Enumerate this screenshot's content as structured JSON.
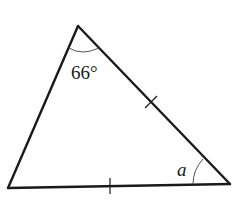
{
  "diagram": {
    "type": "triangle",
    "vertices": {
      "top": [
        78,
        26
      ],
      "bottom_left": [
        8,
        188
      ],
      "bottom_right": [
        230,
        184
      ]
    },
    "angles": {
      "top": {
        "label": "66°",
        "value_degrees": 66
      },
      "bottom_right": {
        "label": "a",
        "value": "unknown"
      }
    },
    "equal_sides": [
      "top-to-bottom_right",
      "bottom_left-to-bottom_right"
    ],
    "tick_marks": [
      {
        "side": "top-to-bottom_right",
        "count": 1
      },
      {
        "side": "bottom_left-to-bottom_right",
        "count": 1
      }
    ],
    "colors": {
      "stroke": "#1a1a1a",
      "arc": "#555555",
      "background": "#ffffff"
    }
  }
}
